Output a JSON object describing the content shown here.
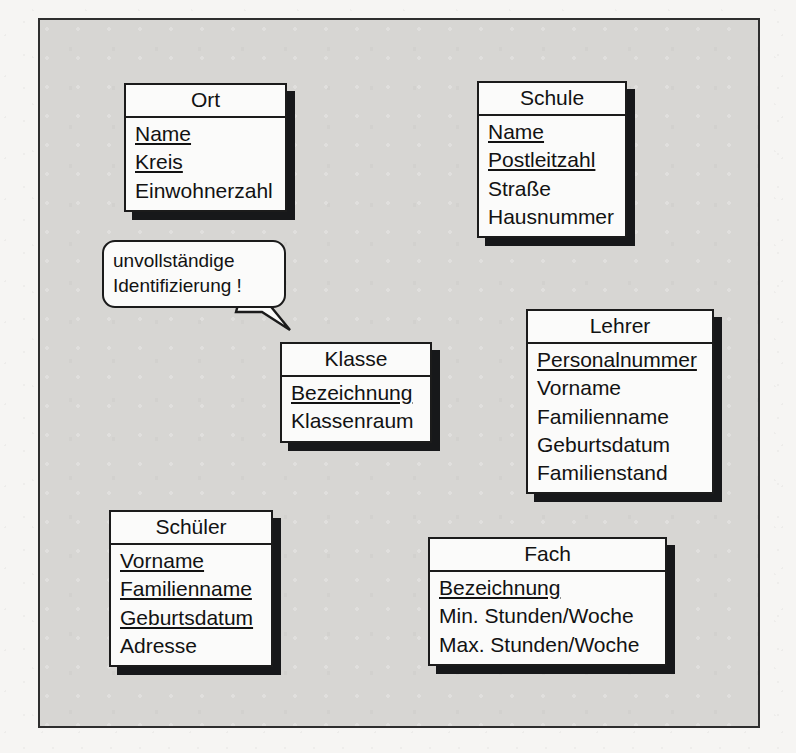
{
  "diagram": {
    "canvas_background": "#d7d6d3",
    "paper_background": "#f6f5f3",
    "border_color": "#2e2e2e",
    "box_fill": "#fbfbfa",
    "box_border": "#1b1b1b",
    "shadow_color": "#17181a"
  },
  "annotation": {
    "name": "unvollstaendige-identifizierung-note",
    "lines": [
      "unvollständige",
      "Identifizierung !"
    ],
    "points_to": "Klasse"
  },
  "classes": [
    {
      "name": "Ort",
      "attributes": [
        {
          "label": "Name",
          "key": true
        },
        {
          "label": "Kreis",
          "key": true
        },
        {
          "label": "Einwohnerzahl",
          "key": false
        }
      ]
    },
    {
      "name": "Schule",
      "attributes": [
        {
          "label": "Name",
          "key": true
        },
        {
          "label": "Postleitzahl",
          "key": true
        },
        {
          "label": "Straße",
          "key": false
        },
        {
          "label": "Hausnummer",
          "key": false
        }
      ]
    },
    {
      "name": "Klasse",
      "attributes": [
        {
          "label": "Bezeichnung",
          "key": true
        },
        {
          "label": "Klassenraum",
          "key": false
        }
      ]
    },
    {
      "name": "Lehrer",
      "attributes": [
        {
          "label": "Personalnummer",
          "key": true
        },
        {
          "label": "Vorname",
          "key": false
        },
        {
          "label": "Familienname",
          "key": false
        },
        {
          "label": "Geburtsdatum",
          "key": false
        },
        {
          "label": "Familienstand",
          "key": false
        }
      ]
    },
    {
      "name": "Schüler",
      "attributes": [
        {
          "label": "Vorname",
          "key": true
        },
        {
          "label": "Familienname",
          "key": true
        },
        {
          "label": "Geburtsdatum",
          "key": true
        },
        {
          "label": "Adresse",
          "key": false
        }
      ]
    },
    {
      "name": "Fach",
      "attributes": [
        {
          "label": "Bezeichnung",
          "key": true
        },
        {
          "label": "Min. Stunden/Woche",
          "key": false
        },
        {
          "label": "Max. Stunden/Woche",
          "key": false
        }
      ]
    }
  ]
}
